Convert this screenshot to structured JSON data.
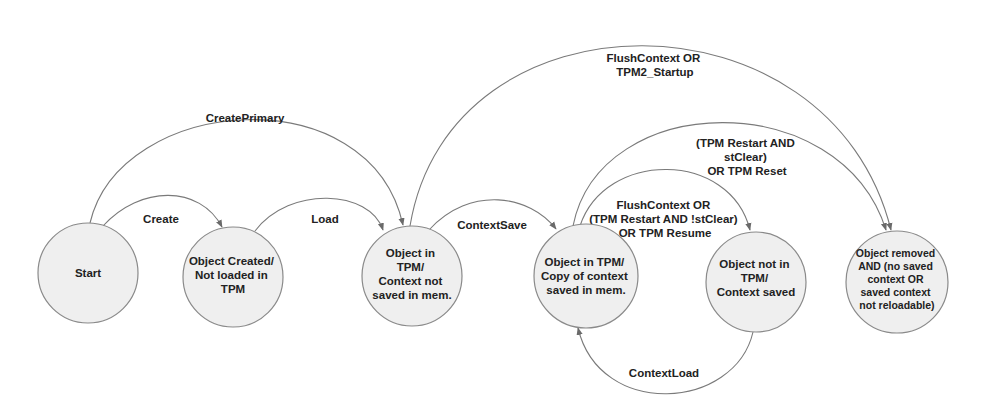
{
  "diagram": {
    "nodes": [
      {
        "id": "start",
        "lines": [
          "Start"
        ]
      },
      {
        "id": "created",
        "lines": [
          "Object Created/",
          "Not loaded in",
          "TPM"
        ]
      },
      {
        "id": "loaded",
        "lines": [
          "Object in",
          "TPM/",
          "Context not",
          "saved in mem."
        ]
      },
      {
        "id": "saved_in_tpm",
        "lines": [
          "Object in TPM/",
          "Copy of context",
          "saved in mem."
        ]
      },
      {
        "id": "not_in_tpm",
        "lines": [
          "Object not in",
          "TPM/",
          "Context saved"
        ]
      },
      {
        "id": "removed",
        "lines": [
          "Object removed",
          "AND (no saved",
          "context OR",
          "saved context",
          "not reloadable)"
        ]
      }
    ],
    "edges": [
      {
        "id": "create",
        "from": "start",
        "to": "created",
        "lines": [
          "Create"
        ]
      },
      {
        "id": "createprimary",
        "from": "start",
        "to": "loaded",
        "lines": [
          "CreatePrimary"
        ]
      },
      {
        "id": "load",
        "from": "created",
        "to": "loaded",
        "lines": [
          "Load"
        ]
      },
      {
        "id": "flush_startup",
        "from": "loaded",
        "to": "removed",
        "lines": [
          "FlushContext OR",
          "TPM2_Startup"
        ]
      },
      {
        "id": "contextsave",
        "from": "loaded",
        "to": "saved_in_tpm",
        "lines": [
          "ContextSave"
        ]
      },
      {
        "id": "restart_reset",
        "from": "saved_in_tpm",
        "to": "removed",
        "lines": [
          "(TPM Restart AND",
          "stClear)",
          "OR TPM Reset"
        ]
      },
      {
        "id": "flush_resume",
        "from": "saved_in_tpm",
        "to": "not_in_tpm",
        "lines": [
          "FlushContext OR",
          "(TPM Restart AND !stClear)",
          "OR TPM Resume"
        ]
      },
      {
        "id": "contextload",
        "from": "not_in_tpm",
        "to": "saved_in_tpm",
        "lines": [
          "ContextLoad"
        ]
      }
    ]
  },
  "colors": {
    "node_fill": "#efefef",
    "node_stroke": "#8a8a8a",
    "edge_stroke": "#7a7a7a",
    "text": "#222222"
  }
}
